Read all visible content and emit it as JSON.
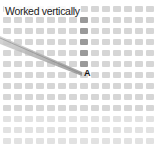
{
  "diagram": {
    "title": "Worked vertically",
    "point_label": "A",
    "grid": {
      "columns": 14,
      "rows": 13,
      "pitch_x": 11,
      "pitch_y": 11,
      "origin_x": 3,
      "origin_y": 4
    },
    "worked_column": 7,
    "worked_rows": [
      1,
      2,
      3,
      4,
      5
    ],
    "colors": {
      "cell": "#d6d6d6",
      "cell_dark": "#9a9a9a",
      "thread": "#9e9e9e",
      "background": "#ffffff"
    }
  }
}
